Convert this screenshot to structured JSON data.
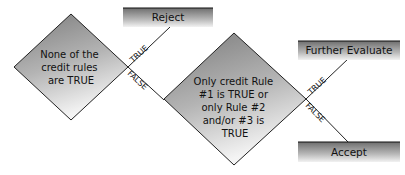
{
  "diagram": {
    "type": "decision-flowchart",
    "decisions": [
      {
        "id": "d1",
        "lines": [
          "None of the",
          "credit rules",
          "are TRUE"
        ]
      },
      {
        "id": "d2",
        "lines": [
          "Only credit Rule",
          "#1 is TRUE or",
          "only Rule #2",
          "and/or #3 is",
          "TRUE"
        ]
      }
    ],
    "outcomes": {
      "reject": "Reject",
      "further_evaluate": "Further Evaluate",
      "accept": "Accept"
    },
    "edges": [
      {
        "from": "d1",
        "to": "reject",
        "label": "TRUE"
      },
      {
        "from": "d1",
        "to": "d2",
        "label": "FALSE"
      },
      {
        "from": "d2",
        "to": "further_evaluate",
        "label": "TRUE"
      },
      {
        "from": "d2",
        "to": "accept",
        "label": "FALSE"
      }
    ],
    "colors": {
      "shape_dark": "#7a7a7a",
      "shape_light": "#f2f2f2",
      "line": "#222222",
      "text": "#111111"
    }
  }
}
